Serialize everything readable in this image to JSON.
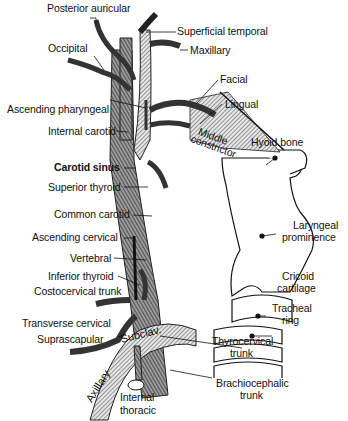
{
  "figure": {
    "labels": {
      "posterior_auricular": "Posterior auricular",
      "superficial_temporal": "Superficial temporal",
      "maxillary": "Maxillary",
      "occipital": "Occipital",
      "facial": "Facial",
      "lingual": "Lingual",
      "ascending_pharyngeal": "Ascending pharyngeal",
      "internal_carotid": "Internal carotid",
      "middle_constrictor_1": "Middle",
      "middle_constrictor_2": "constrictor",
      "hyoid_bone": "Hyoid bone",
      "carotid_sinus": "Carotid sinus",
      "superior_thyroid": "Superior thyroid",
      "laryngeal_prominence_1": "Laryngeal",
      "laryngeal_prominence_2": "prominence",
      "common_carotid": "Common carotid",
      "ascending_cervical": "Ascending cervical",
      "vertebral": "Vertebral",
      "cricoid_cartilage_1": "Cricoid",
      "cricoid_cartilage_2": "cartilage",
      "inferior_thyroid": "Inferior thyroid",
      "costocervical_trunk": "Costocervical trunk",
      "tracheal_ring_1": "Tracheal",
      "tracheal_ring_2": "ring",
      "transverse_cervical": "Transverse cervical",
      "suprascapular": "Suprascapular",
      "thyrocervical_trunk_1": "Thyrocervical",
      "thyrocervical_trunk_2": "trunk",
      "subclavian_inline": "Subclav.",
      "axillary_inline": "Axillary",
      "internal_thoracic_1": "Internal",
      "internal_thoracic_2": "thoracic",
      "brachiocephalic_trunk_1": "Brachiocephalic",
      "brachiocephalic_trunk_2": "trunk"
    }
  }
}
